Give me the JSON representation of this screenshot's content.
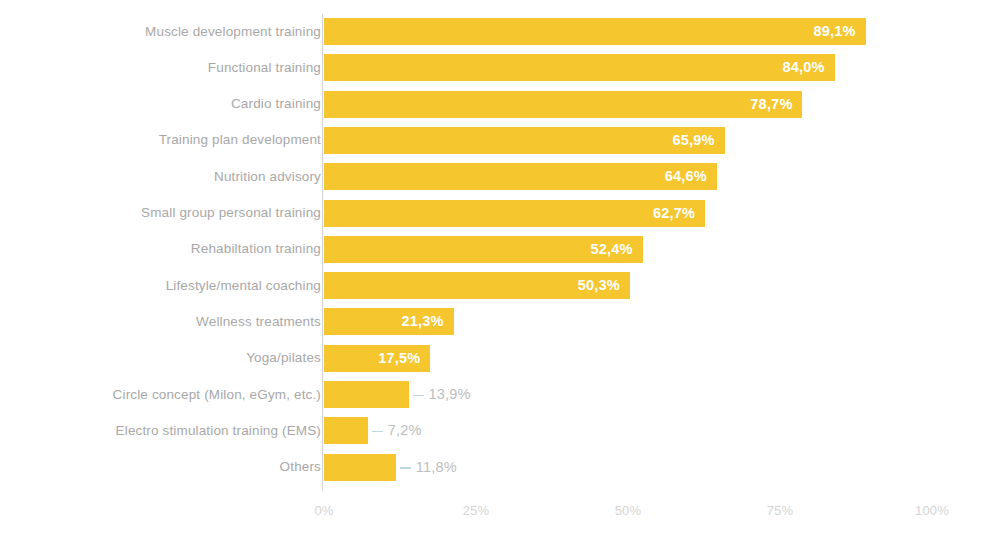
{
  "chart_data": {
    "type": "bar",
    "orientation": "horizontal",
    "title": "",
    "subtitle": "",
    "xlabel": "",
    "ylabel": "",
    "xlim": [
      0,
      100
    ],
    "grid": false,
    "legend": null,
    "value_suffix": "%",
    "decimal_separator": ",",
    "bar_color": "#f6c62f",
    "inside_label_color": "#ffffff",
    "outside_label_color": "#bdbdbd",
    "category_label_color": "#a8a8a8",
    "tick_label_color": "#d4d4d4",
    "axis_line_color": "#cfc9d6",
    "leader_line_color": "#bcd7de",
    "xticks": [
      0,
      25,
      50,
      75,
      100
    ],
    "xtick_labels": [
      "0%",
      "25%",
      "50%",
      "75%",
      "100%"
    ],
    "categories": [
      "Muscle development training",
      "Functional training",
      "Cardio training",
      "Training plan development",
      "Nutrition advisory",
      "Small group personal training",
      "Rehabiltation training",
      "Lifestyle/mental coaching",
      "Wellness treatments",
      "Yoga/pilates",
      "Circle concept (Milon, eGym, etc.)",
      "Electro stimulation training (EMS)",
      "Others"
    ],
    "values": [
      89.1,
      84.0,
      78.7,
      65.9,
      64.6,
      62.7,
      52.4,
      50.3,
      21.3,
      17.5,
      13.9,
      7.2,
      11.8
    ],
    "value_labels": [
      "89,1%",
      "84,0%",
      "78,7%",
      "65,9%",
      "64,6%",
      "62,7%",
      "52,4%",
      "50,3%",
      "21,3%",
      "17,5%",
      "13,9%",
      "7,2%",
      "11,8%"
    ],
    "label_placement": [
      "inside",
      "inside",
      "inside",
      "inside",
      "inside",
      "inside",
      "inside",
      "inside",
      "inside",
      "inside",
      "outside",
      "outside",
      "outside"
    ]
  }
}
